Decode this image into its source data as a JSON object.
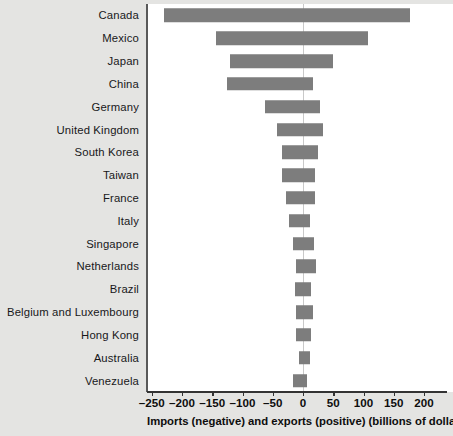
{
  "chart_data": {
    "type": "bar",
    "orientation": "horizontal",
    "title": "",
    "xlabel": "Imports (negative) and exports (positive) (billions of dollars)",
    "ylabel": "",
    "xlim": [
      -250,
      200
    ],
    "xticks": [
      -250,
      -200,
      -150,
      -100,
      -50,
      0,
      50,
      100,
      150,
      200
    ],
    "xtick_labels": [
      "–250",
      "–200",
      "–150",
      "–100",
      "–50",
      "0",
      "50",
      "100",
      "150",
      "200"
    ],
    "grid": false,
    "legend": null,
    "zero_line": 0,
    "bar_color": "#7d7d7d",
    "categories": [
      "Canada",
      "Mexico",
      "Japan",
      "China",
      "Germany",
      "United Kingdom",
      "South Korea",
      "Taiwan",
      "France",
      "Italy",
      "Singapore",
      "Netherlands",
      "Brazil",
      "Belgium and Luxembourg",
      "Hong Kong",
      "Australia",
      "Venezuela"
    ],
    "series": [
      {
        "name": "Imports (negative)",
        "values": [
          -230,
          -144,
          -121,
          -125,
          -63,
          -43,
          -35,
          -34,
          -28,
          -23,
          -16,
          -11,
          -14,
          -12,
          -11,
          -7,
          -17
        ]
      },
      {
        "name": "Exports (positive)",
        "values": [
          177,
          107,
          50,
          16,
          28,
          33,
          25,
          20,
          20,
          11,
          18,
          22,
          14,
          16,
          14,
          12,
          6
        ]
      }
    ]
  },
  "figure": {
    "background_color": "#e4e4e2",
    "panel_color": "#ffffff",
    "axis_color": "#333333"
  }
}
